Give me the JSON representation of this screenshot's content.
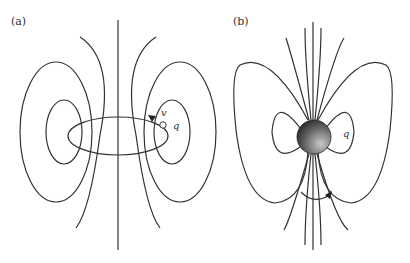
{
  "panels": [
    {
      "label": "(a)",
      "velocity_label": "v",
      "charge_label": "q"
    },
    {
      "label": "(b)",
      "charge_label": "q"
    }
  ],
  "colors": {
    "line": "#333333",
    "sphere_light": "#bbbbbb",
    "sphere_dark": "#1a1a1a"
  }
}
